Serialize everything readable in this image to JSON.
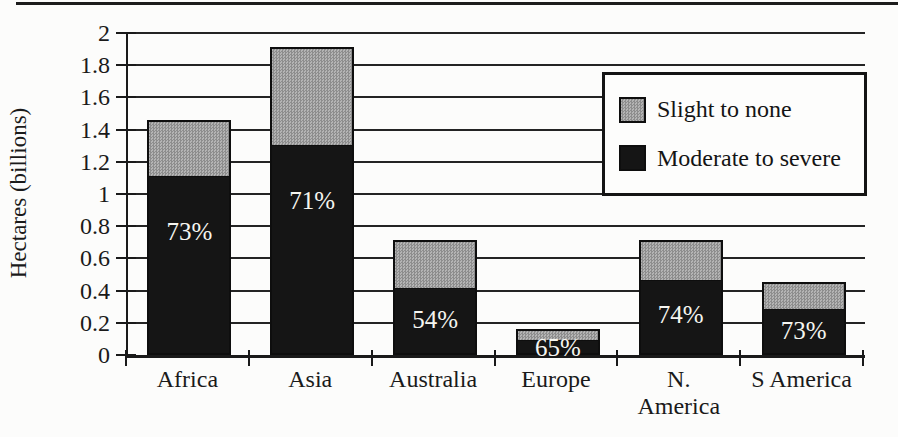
{
  "figure": {
    "ylabel": "Hectares (billions)"
  },
  "chart_data": {
    "type": "bar",
    "stacked": true,
    "title": "",
    "xlabel": "",
    "ylabel": "Hectares (billions)",
    "ylim": [
      0,
      2
    ],
    "grid": true,
    "categories": [
      "Africa",
      "Asia",
      "Australia",
      "Europe",
      "N.\nAmerica",
      "S America"
    ],
    "series": [
      {
        "name": "Moderate to severe",
        "color": "#151515",
        "values": [
          1.12,
          1.31,
          0.42,
          0.1,
          0.47,
          0.29
        ]
      },
      {
        "name": "Slight to none",
        "color": "#a0a0a0",
        "values": [
          0.34,
          0.6,
          0.29,
          0.06,
          0.24,
          0.16
        ]
      }
    ],
    "totals": [
      1.46,
      1.91,
      0.71,
      0.16,
      0.71,
      0.45
    ],
    "bar_labels": [
      "73%",
      "71%",
      "54%",
      "65%",
      "74%",
      "73%"
    ],
    "ytick_labels": [
      "0",
      "0.2",
      "0.4",
      "0.6",
      "0.8",
      "1",
      "1.2",
      "1.4",
      "1.6",
      "1.8",
      "2"
    ],
    "yticks": [
      0,
      0.2,
      0.4,
      0.6,
      0.8,
      1,
      1.2,
      1.4,
      1.6,
      1.8,
      2
    ],
    "legend": {
      "position": "top-right",
      "items": [
        {
          "label": "Slight to none",
          "color": "#a0a0a0",
          "pattern": "halftone-gray"
        },
        {
          "label": "Moderate to severe",
          "color": "#151515",
          "pattern": "solid-black"
        }
      ]
    }
  }
}
